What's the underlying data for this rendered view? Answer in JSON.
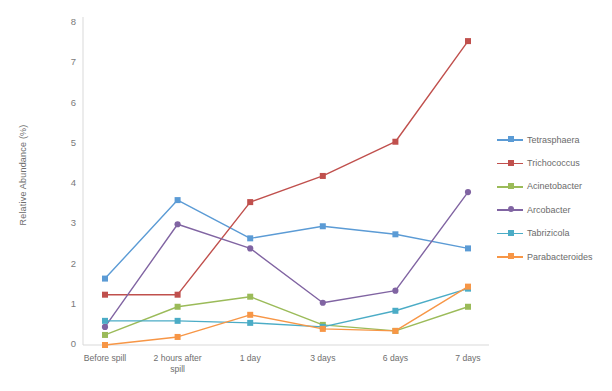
{
  "chart_data": {
    "type": "line",
    "title": "",
    "xlabel": "",
    "ylabel": "Relative Abundance (%)",
    "categories": [
      "Before spill",
      "2 hours after spill",
      "1 day",
      "3 days",
      "6 days",
      "7 days"
    ],
    "ylim": [
      0,
      8
    ],
    "yticks": [
      0,
      1,
      2,
      3,
      4,
      5,
      6,
      7,
      8
    ],
    "grid": false,
    "legend_position": "right",
    "series": [
      {
        "name": "Tetrasphaera",
        "color": "#5B9BD5",
        "marker": "square",
        "values": [
          1.65,
          3.6,
          2.65,
          2.95,
          2.75,
          2.4
        ]
      },
      {
        "name": "Trichococcus",
        "color": "#C0504D",
        "marker": "square",
        "values": [
          1.25,
          1.25,
          3.55,
          4.2,
          5.05,
          7.55
        ]
      },
      {
        "name": "Acinetobacter",
        "color": "#9BBB59",
        "marker": "square",
        "values": [
          0.25,
          0.95,
          1.2,
          0.5,
          0.35,
          0.95
        ]
      },
      {
        "name": "Arcobacter",
        "color": "#8064A2",
        "marker": "circle",
        "values": [
          0.45,
          3.0,
          2.4,
          1.05,
          1.35,
          3.8
        ]
      },
      {
        "name": "Tabrizicola",
        "color": "#4BACC6",
        "marker": "square",
        "values": [
          0.6,
          0.6,
          0.55,
          0.45,
          0.85,
          1.4
        ]
      },
      {
        "name": "Parabacteroides",
        "color": "#F79646",
        "marker": "square",
        "values": [
          0.0,
          0.2,
          0.75,
          0.4,
          0.35,
          1.45
        ]
      }
    ]
  },
  "axis": {
    "y_label": "Relative Abundance (%)",
    "y_ticks": [
      "0",
      "1",
      "2",
      "3",
      "4",
      "5",
      "6",
      "7",
      "8"
    ],
    "x_ticks": [
      {
        "line1": "Before spill",
        "line2": ""
      },
      {
        "line1": "2 hours after",
        "line2": "spill"
      },
      {
        "line1": "1 day",
        "line2": ""
      },
      {
        "line1": "3 days",
        "line2": ""
      },
      {
        "line1": "6 days",
        "line2": ""
      },
      {
        "line1": "7 days",
        "line2": ""
      }
    ]
  },
  "legend": {
    "items": [
      {
        "label": "Tetrasphaera",
        "color": "#5B9BD5"
      },
      {
        "label": "Trichococcus",
        "color": "#C0504D"
      },
      {
        "label": "Acinetobacter",
        "color": "#9BBB59"
      },
      {
        "label": "Arcobacter",
        "color": "#8064A2"
      },
      {
        "label": "Tabrizicola",
        "color": "#4BACC6"
      },
      {
        "label": "Parabacteroides",
        "color": "#F79646"
      }
    ]
  }
}
